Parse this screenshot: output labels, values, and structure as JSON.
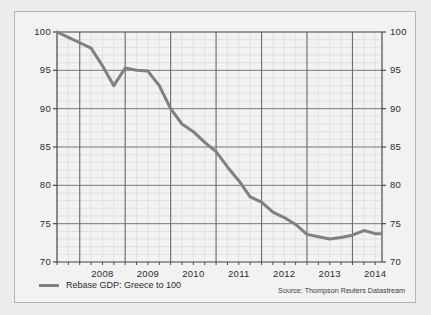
{
  "legend": {
    "swatch_color": "#807f83",
    "label": "Rebase GDP: Greece to 100"
  },
  "source": {
    "text": "Source: Thompson Reuters Datastream"
  },
  "chart_data": {
    "type": "line",
    "title": "",
    "xlabel": "",
    "ylabel": "",
    "ylim": [
      70,
      100
    ],
    "xlim": [
      2007.5,
      2014.65
    ],
    "y_ticks": [
      70,
      75,
      80,
      85,
      90,
      95,
      100
    ],
    "y_ticks_right": [
      70,
      75,
      80,
      85,
      90,
      95,
      100
    ],
    "x_tick_labels": [
      "2008",
      "2009",
      "2010",
      "2011",
      "2012",
      "2013",
      "2014"
    ],
    "x_tick_positions": [
      2008.5,
      2009.5,
      2010.5,
      2011.5,
      2012.5,
      2013.5,
      2014.5
    ],
    "x_major_gridlines": [
      2008,
      2009,
      2010,
      2011,
      2012,
      2013,
      2014
    ],
    "grid": true,
    "minor_grid": true,
    "minor_grid_x_step": 0.25,
    "minor_grid_y_step": 1,
    "legend_position": "below-left",
    "line_color": "#807f83",
    "line_width": 3,
    "series": [
      {
        "name": "Rebase GDP: Greece to 100",
        "x": [
          2007.5,
          2007.75,
          2008.0,
          2008.25,
          2008.5,
          2008.75,
          2009.0,
          2009.25,
          2009.5,
          2009.75,
          2010.0,
          2010.25,
          2010.5,
          2010.75,
          2011.0,
          2011.25,
          2011.5,
          2011.75,
          2012.0,
          2012.25,
          2012.5,
          2012.75,
          2013.0,
          2013.25,
          2013.5,
          2013.75,
          2014.0,
          2014.25,
          2014.5,
          2014.62
        ],
        "values": [
          100.0,
          99.3,
          98.6,
          97.9,
          95.6,
          93.0,
          95.3,
          95.0,
          94.9,
          93.0,
          90.0,
          88.0,
          87.0,
          85.6,
          84.4,
          82.4,
          80.6,
          78.5,
          77.8,
          76.5,
          75.8,
          74.9,
          73.6,
          73.3,
          73.0,
          73.2,
          73.5,
          74.1,
          73.7,
          73.7
        ]
      }
    ]
  }
}
